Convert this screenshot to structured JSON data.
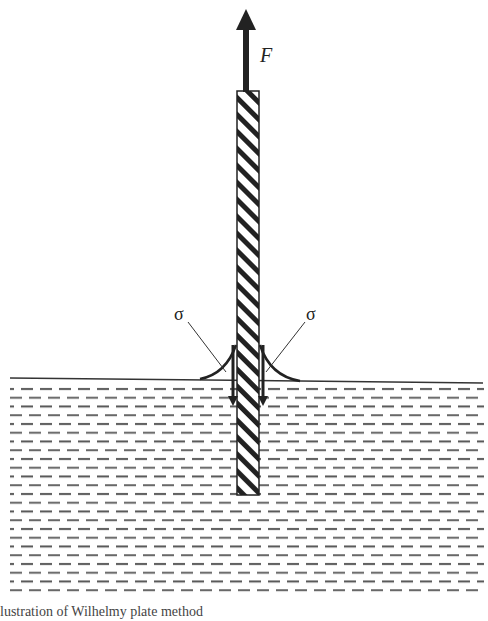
{
  "diagram": {
    "force_label": "F",
    "tension_left_label": "σ",
    "tension_right_label": "σ",
    "caption": "lustration of Wilhelmy plate method"
  },
  "colors": {
    "ink": "#222222",
    "dash": "#555555",
    "background": "#ffffff"
  }
}
